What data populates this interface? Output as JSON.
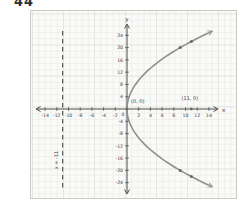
{
  "problem_number": "44",
  "chart_data": {
    "type": "line",
    "title": "",
    "equation": "y^2 = 44x",
    "xlabel": "x",
    "ylabel": "y",
    "xlim": [
      -15.5,
      15.5
    ],
    "ylim": [
      -26.5,
      26.5
    ],
    "x_tick_step": 2,
    "y_tick_step": 4,
    "x_ticks": [
      -14,
      -12,
      -10,
      -8,
      -6,
      -4,
      -2,
      2,
      4,
      6,
      8,
      10,
      12,
      14
    ],
    "y_ticks": [
      -24,
      -20,
      -16,
      -12,
      -8,
      -4,
      4,
      8,
      12,
      16,
      20,
      24
    ],
    "origin_tick_label": "0",
    "grid": true,
    "series": [
      {
        "name": "parabola",
        "rule": "x = y^2 / 44",
        "y_range": [
          -25.2,
          25.2
        ],
        "marked_points": [
          [
            9.09,
            20
          ],
          [
            11,
            22
          ],
          [
            9.09,
            -20
          ],
          [
            11,
            -22
          ]
        ]
      }
    ],
    "labeled_points": [
      {
        "x": 0,
        "y": 0,
        "label": "(0, 0)"
      },
      {
        "x": 11,
        "y": 0,
        "label": "(11, 0)"
      }
    ],
    "directrix": {
      "x": -11,
      "label": "x = -11"
    },
    "colors": {
      "paper": "#fafaf8",
      "grid_minor": "#e7e9e5",
      "grid_major": "#d5d8d3",
      "axis": "#4d4d4d",
      "curve": "#8f8f8f",
      "point": "#696969",
      "dashed_line": "#585858",
      "text": "#3d3d3d"
    }
  }
}
